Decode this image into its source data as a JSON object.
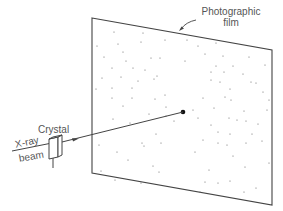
{
  "diagram": {
    "labels": {
      "film_line1": "Photographic",
      "film_line2": "film",
      "crystal": "Crystal",
      "xray": "X-ray",
      "beam": "beam"
    },
    "colors": {
      "line": "#444444",
      "text": "#555555",
      "dot": "#666666",
      "center_spot": "#111111",
      "background": "#ffffff"
    },
    "film": {
      "corners": [
        [
          92,
          18
        ],
        [
          272,
          50
        ],
        [
          272,
          205
        ],
        [
          92,
          173
        ]
      ]
    },
    "center_spot": [
      183,
      112
    ],
    "spots": [
      [
        114,
        32
      ],
      [
        143,
        33
      ],
      [
        97,
        46
      ],
      [
        118,
        44
      ],
      [
        141,
        42
      ],
      [
        165,
        40
      ],
      [
        123,
        52
      ],
      [
        104,
        57
      ],
      [
        126,
        61
      ],
      [
        151,
        58
      ],
      [
        160,
        58
      ],
      [
        145,
        70
      ],
      [
        133,
        68
      ],
      [
        112,
        68
      ],
      [
        102,
        78
      ],
      [
        121,
        77
      ],
      [
        138,
        81
      ],
      [
        154,
        79
      ],
      [
        157,
        76
      ],
      [
        96,
        89
      ],
      [
        112,
        88
      ],
      [
        132,
        88
      ],
      [
        165,
        95
      ],
      [
        112,
        98
      ],
      [
        132,
        98
      ],
      [
        155,
        99
      ],
      [
        123,
        106
      ],
      [
        166,
        107
      ],
      [
        113,
        119
      ],
      [
        130,
        123
      ],
      [
        149,
        114
      ],
      [
        166,
        116
      ],
      [
        174,
        121
      ],
      [
        187,
        40
      ],
      [
        198,
        46
      ],
      [
        216,
        43
      ],
      [
        205,
        54
      ],
      [
        223,
        56
      ],
      [
        249,
        57
      ],
      [
        185,
        61
      ],
      [
        216,
        66
      ],
      [
        233,
        66
      ],
      [
        265,
        65
      ],
      [
        211,
        72
      ],
      [
        224,
        72
      ],
      [
        243,
        74
      ],
      [
        211,
        80
      ],
      [
        220,
        82
      ],
      [
        251,
        82
      ],
      [
        230,
        89
      ],
      [
        256,
        83
      ],
      [
        263,
        92
      ],
      [
        269,
        100
      ],
      [
        225,
        97
      ],
      [
        203,
        98
      ],
      [
        214,
        108
      ],
      [
        244,
        111
      ],
      [
        231,
        100
      ],
      [
        193,
        110
      ],
      [
        267,
        110
      ],
      [
        198,
        118
      ],
      [
        229,
        118
      ],
      [
        211,
        125
      ],
      [
        237,
        120
      ],
      [
        246,
        121
      ],
      [
        258,
        124
      ],
      [
        218,
        132
      ],
      [
        230,
        134
      ],
      [
        252,
        134
      ],
      [
        203,
        140
      ],
      [
        218,
        143
      ],
      [
        227,
        145
      ],
      [
        246,
        143
      ],
      [
        262,
        141
      ],
      [
        195,
        152
      ],
      [
        233,
        156
      ],
      [
        245,
        167
      ],
      [
        209,
        170
      ],
      [
        269,
        163
      ],
      [
        205,
        182
      ],
      [
        218,
        183
      ],
      [
        230,
        181
      ],
      [
        200,
        192
      ],
      [
        244,
        192
      ],
      [
        256,
        188
      ],
      [
        99,
        145
      ],
      [
        117,
        152
      ],
      [
        128,
        160
      ],
      [
        144,
        146
      ],
      [
        142,
        143
      ],
      [
        156,
        134
      ],
      [
        161,
        143
      ],
      [
        115,
        180
      ],
      [
        141,
        183
      ],
      [
        153,
        166
      ],
      [
        159,
        172
      ],
      [
        101,
        171
      ]
    ],
    "beam_in": {
      "from": [
        12,
        151
      ],
      "to": [
        52,
        143
      ]
    },
    "beam_out": {
      "from": [
        62,
        142
      ],
      "to": [
        183,
        112
      ]
    },
    "arrowhead": {
      "at": [
        76,
        139
      ]
    }
  }
}
